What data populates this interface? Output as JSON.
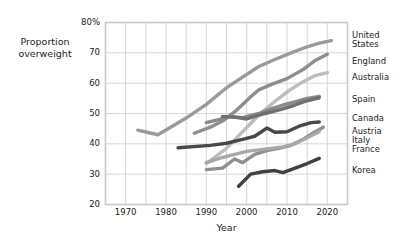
{
  "chart_data": {
    "type": "line",
    "title": "",
    "xlabel": "Year",
    "ylabel": "Proportion overweight",
    "ylabel_lines": [
      "Proportion",
      "overweight"
    ],
    "xlim": [
      1965,
      2025
    ],
    "ylim": [
      20,
      80
    ],
    "grid": true,
    "x_major_ticks": [
      1970,
      1980,
      1990,
      2000,
      2010,
      2020
    ],
    "x_minor_step": 5,
    "y_major_ticks": [
      20,
      30,
      40,
      50,
      60,
      70,
      80
    ],
    "y_tick_labels": [
      "20",
      "30",
      "40",
      "50",
      "60",
      "70",
      "80%"
    ],
    "legend_position": "right-of-plot",
    "series": [
      {
        "name": "United States",
        "color": "#9a9a9a",
        "label_lines": [
          "United",
          "States"
        ],
        "points": [
          [
            1973,
            44.5
          ],
          [
            1978,
            43.0
          ],
          [
            1985,
            48.5
          ],
          [
            1990,
            53.0
          ],
          [
            1995,
            58.5
          ],
          [
            1999,
            62.0
          ],
          [
            2003,
            65.5
          ],
          [
            2007,
            67.8
          ],
          [
            2011,
            70.0
          ],
          [
            2015,
            72.0
          ],
          [
            2018,
            73.2
          ],
          [
            2021,
            74.0
          ]
        ]
      },
      {
        "name": "England",
        "color": "#8e8e8e",
        "label_lines": [
          "England"
        ],
        "points": [
          [
            1987,
            43.5
          ],
          [
            1991,
            45.5
          ],
          [
            1994,
            47.5
          ],
          [
            1997,
            50.5
          ],
          [
            1999,
            53.0
          ],
          [
            2001,
            55.5
          ],
          [
            2003,
            57.8
          ],
          [
            2006,
            59.5
          ],
          [
            2010,
            61.5
          ],
          [
            2014,
            64.5
          ],
          [
            2017,
            67.5
          ],
          [
            2020,
            69.5
          ]
        ]
      },
      {
        "name": "Australia",
        "color": "#bdbdbd",
        "label_lines": [
          "Australia"
        ],
        "points": [
          [
            1990,
            33.5
          ],
          [
            1995,
            38.5
          ],
          [
            1999,
            44.0
          ],
          [
            2003,
            49.5
          ],
          [
            2007,
            54.0
          ],
          [
            2011,
            58.0
          ],
          [
            2014,
            60.5
          ],
          [
            2017,
            62.5
          ],
          [
            2020,
            63.5
          ]
        ]
      },
      {
        "name": "Spain",
        "color": "#8a8a8a",
        "label_lines": [
          "Spain"
        ],
        "points": [
          [
            1990,
            47.0
          ],
          [
            1993,
            48.0
          ],
          [
            1996,
            49.0
          ],
          [
            1999,
            48.6
          ],
          [
            2003,
            50.0
          ],
          [
            2006,
            51.5
          ],
          [
            2009,
            52.8
          ],
          [
            2012,
            53.8
          ],
          [
            2015,
            55.0
          ],
          [
            2018,
            55.6
          ]
        ]
      },
      {
        "name": "Canada",
        "color": "#707070",
        "label_lines": [
          "Canada"
        ],
        "points": [
          [
            1994,
            49.0
          ],
          [
            1997,
            48.8
          ],
          [
            2000,
            48.2
          ],
          [
            2003,
            49.5
          ],
          [
            2006,
            50.5
          ],
          [
            2009,
            51.5
          ],
          [
            2012,
            52.8
          ],
          [
            2015,
            54.2
          ],
          [
            2018,
            55.2
          ]
        ]
      },
      {
        "name": "Austria",
        "color": "#484848",
        "label_lines": [
          "Austria"
        ],
        "points": [
          [
            1983,
            38.7
          ],
          [
            1991,
            39.5
          ],
          [
            1995,
            40.2
          ],
          [
            1999,
            41.5
          ],
          [
            2002,
            42.5
          ],
          [
            2005,
            45.2
          ],
          [
            2007,
            43.8
          ],
          [
            2010,
            44.0
          ],
          [
            2013,
            45.8
          ],
          [
            2016,
            47.0
          ],
          [
            2018,
            47.2
          ]
        ]
      },
      {
        "name": "Italy",
        "color": "#8f8f8f",
        "label_lines": [
          "Italy"
        ],
        "points": [
          [
            1990,
            31.5
          ],
          [
            1994,
            32.0
          ],
          [
            1997,
            35.0
          ],
          [
            1999,
            33.8
          ],
          [
            2002,
            36.5
          ],
          [
            2005,
            37.8
          ],
          [
            2008,
            38.5
          ],
          [
            2011,
            39.5
          ],
          [
            2014,
            41.5
          ],
          [
            2017,
            44.0
          ],
          [
            2019,
            45.5
          ]
        ]
      },
      {
        "name": "France",
        "color": "#a8a8a8",
        "label_lines": [
          "France"
        ],
        "points": [
          [
            1990,
            33.8
          ],
          [
            1994,
            35.5
          ],
          [
            1997,
            36.5
          ],
          [
            2000,
            37.5
          ],
          [
            2003,
            38.0
          ],
          [
            2006,
            38.5
          ],
          [
            2009,
            39.0
          ],
          [
            2012,
            40.0
          ],
          [
            2015,
            42.0
          ],
          [
            2018,
            44.0
          ]
        ]
      },
      {
        "name": "Korea",
        "color": "#404040",
        "label_lines": [
          "Korea"
        ],
        "points": [
          [
            1998,
            26.0
          ],
          [
            2001,
            30.0
          ],
          [
            2004,
            30.8
          ],
          [
            2007,
            31.2
          ],
          [
            2009,
            30.5
          ],
          [
            2012,
            32.0
          ],
          [
            2015,
            33.5
          ],
          [
            2018,
            35.2
          ]
        ]
      }
    ]
  },
  "legend": [
    {
      "id": "united-states",
      "lines": [
        "United",
        "States"
      ],
      "top": 31
    },
    {
      "id": "england",
      "lines": [
        "England"
      ],
      "top": 57
    },
    {
      "id": "australia",
      "lines": [
        "Australia"
      ],
      "top": 73
    },
    {
      "id": "spain",
      "lines": [
        "Spain"
      ],
      "top": 95
    },
    {
      "id": "canada",
      "lines": [
        "Canada"
      ],
      "top": 114
    },
    {
      "id": "austria",
      "lines": [
        "Austria"
      ],
      "top": 127
    },
    {
      "id": "italy",
      "lines": [
        "Italy"
      ],
      "top": 136
    },
    {
      "id": "france",
      "lines": [
        "France"
      ],
      "top": 145
    },
    {
      "id": "korea",
      "lines": [
        "Korea"
      ],
      "top": 166
    }
  ],
  "colors": {
    "plot_border": "#c9c9c9",
    "gridline": "#d6d6d6",
    "text": "#1a1a1a",
    "background": "#ffffff"
  }
}
